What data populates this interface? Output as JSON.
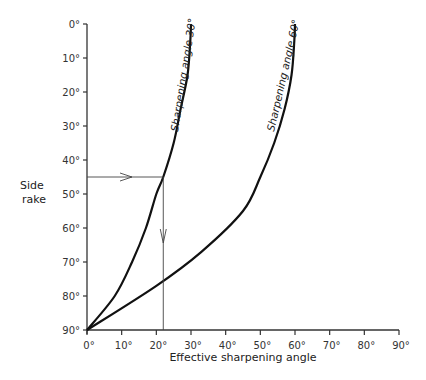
{
  "chart_data": {
    "type": "line",
    "title": "",
    "xlabel": "Effective sharpening angle",
    "ylabel": "Side rake",
    "xlim": [
      0,
      90
    ],
    "ylim": [
      90,
      0
    ],
    "y_inverted": true,
    "grid": false,
    "x_ticks": [
      "0°",
      "10°",
      "20°",
      "30°",
      "40°",
      "50°",
      "60°",
      "70°",
      "80°",
      "90°"
    ],
    "y_ticks": [
      "0°",
      "10°",
      "20°",
      "30°",
      "40°",
      "50°",
      "60°",
      "70°",
      "80°",
      "90°"
    ],
    "series": [
      {
        "name": "Sharpening angle 30°",
        "points": [
          [
            0,
            90
          ],
          [
            8,
            80
          ],
          [
            13,
            70
          ],
          [
            17,
            60
          ],
          [
            20,
            50
          ],
          [
            22,
            45
          ],
          [
            25,
            35
          ],
          [
            27,
            25
          ],
          [
            29,
            15
          ],
          [
            29.8,
            5
          ],
          [
            30,
            0
          ]
        ]
      },
      {
        "name": "Sharpening angle 60°",
        "points": [
          [
            0,
            90
          ],
          [
            20,
            77
          ],
          [
            33,
            67
          ],
          [
            45,
            55
          ],
          [
            50,
            45
          ],
          [
            54,
            35
          ],
          [
            57,
            25
          ],
          [
            59,
            15
          ],
          [
            59.8,
            5
          ],
          [
            60,
            0
          ]
        ]
      }
    ],
    "annotations": [
      {
        "type": "arrow-horizontal",
        "from": [
          0,
          45
        ],
        "to": [
          22,
          45
        ],
        "label": ""
      },
      {
        "type": "arrow-vertical",
        "from": [
          22,
          45
        ],
        "to": [
          22,
          90
        ],
        "label": ""
      }
    ]
  },
  "labels": {
    "y_title_line1": "Side",
    "y_title_line2": "rake",
    "x_title": "Effective sharpening angle",
    "curve1": "Sharpening angle 30°",
    "curve2": "Sharpening angle 60°"
  }
}
